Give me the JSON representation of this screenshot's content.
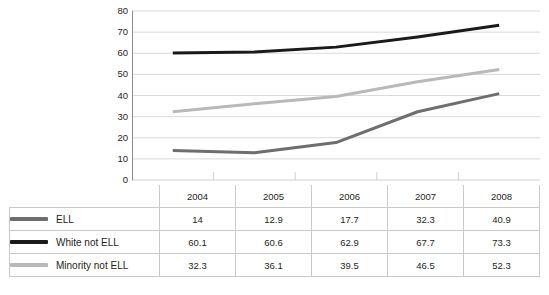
{
  "chart_data": {
    "type": "line",
    "title": "",
    "xlabel": "",
    "ylabel": "",
    "categories": [
      "2004",
      "2005",
      "2006",
      "2007",
      "2008"
    ],
    "ylim": [
      0,
      80
    ],
    "y_ticks": [
      0,
      10,
      20,
      30,
      40,
      50,
      60,
      70,
      80
    ],
    "grid": "horizontal",
    "legend_position": "table-left",
    "series": [
      {
        "name": "ELL",
        "color": "#6e6e6e",
        "values": [
          14,
          12.9,
          17.7,
          32.3,
          40.9
        ]
      },
      {
        "name": "White not ELL",
        "color": "#1a1a1a",
        "values": [
          60.1,
          60.6,
          62.9,
          67.7,
          73.3
        ]
      },
      {
        "name": "Minority not ELL",
        "color": "#b9b9b9",
        "values": [
          32.3,
          36.1,
          39.5,
          46.5,
          52.3
        ]
      }
    ]
  },
  "table": {
    "corner_label": "",
    "column_headers": [
      "2004",
      "2005",
      "2006",
      "2007",
      "2008"
    ],
    "rows": [
      {
        "label": "ELL",
        "values": [
          "14",
          "12.9",
          "17.7",
          "32.3",
          "40.9"
        ]
      },
      {
        "label": "White not ELL",
        "values": [
          "60.1",
          "60.6",
          "62.9",
          "67.7",
          "73.3"
        ]
      },
      {
        "label": "Minority not ELL",
        "values": [
          "32.3",
          "36.1",
          "39.5",
          "46.5",
          "52.3"
        ]
      }
    ]
  },
  "colors": {
    "axis": "#8c8c8c",
    "grid": "#d0d0d0",
    "table_border": "#c9c9c9",
    "text": "#231f20",
    "background": "#ffffff"
  }
}
